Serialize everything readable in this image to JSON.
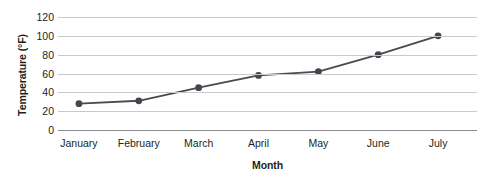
{
  "chart_data": {
    "type": "line",
    "title": "",
    "subtitle": "",
    "xlabel": "Month",
    "ylabel": "Temperature (°F)",
    "categories": [
      "January",
      "February",
      "March",
      "April",
      "May",
      "June",
      "July"
    ],
    "values": [
      28,
      31,
      45,
      58,
      62,
      80,
      100
    ],
    "series": [
      {
        "name": "Temperature",
        "values": [
          28,
          31,
          45,
          58,
          62,
          80,
          100
        ]
      }
    ],
    "ylim": [
      0,
      120
    ],
    "ytick_labels": [
      "0",
      "20",
      "40",
      "60",
      "80",
      "100",
      "120"
    ],
    "ytick_values": [
      0,
      20,
      40,
      60,
      80,
      100,
      120
    ],
    "grid": "horizontal",
    "legend": "none",
    "marker": "circle",
    "colors": {
      "line": "#4a4a52",
      "marker": "#45454d",
      "gridline": "#c9c9cd",
      "baseline": "#8b8b91",
      "text": "#231f20",
      "background": "#ffffff"
    }
  }
}
